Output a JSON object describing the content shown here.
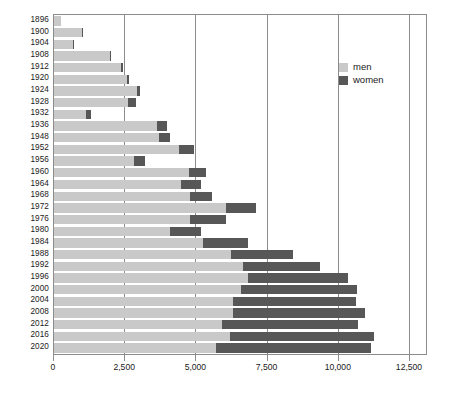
{
  "chart_data": {
    "type": "bar",
    "orientation": "horizontal",
    "stacked": true,
    "title": "",
    "subtitle": "",
    "xlabel": "",
    "ylabel": "",
    "xlim": [
      0,
      12500
    ],
    "ylim": null,
    "grid": true,
    "gridlines_x": [
      2500,
      5000,
      7500,
      10000,
      12500
    ],
    "legend_position": "top-right",
    "legend": [
      "men",
      "women"
    ],
    "xtick_labels": [
      "0",
      "2,500",
      "5,000",
      "7,500",
      "10,000",
      "12,500"
    ],
    "xticks": [
      0,
      2500,
      5000,
      7500,
      10000,
      12500
    ],
    "categories": [
      "1896",
      "1900",
      "1904",
      "1908",
      "1912",
      "1920",
      "1924",
      "1928",
      "1932",
      "1936",
      "1948",
      "1952",
      "1956",
      "1960",
      "1964",
      "1968",
      "1972",
      "1976",
      "1980",
      "1984",
      "1988",
      "1992",
      "1996",
      "2000",
      "2004",
      "2008",
      "2012",
      "2016",
      "2020"
    ],
    "series": [
      {
        "name": "men",
        "color": "#c9c9c9",
        "values": [
          240,
          975,
          650,
          1970,
          2360,
          2560,
          2900,
          2600,
          1130,
          3630,
          3700,
          4400,
          2810,
          4730,
          4470,
          4770,
          6040,
          4780,
          4060,
          5230,
          6200,
          6650,
          6800,
          6580,
          6290,
          6290,
          5890,
          6180,
          5690
        ]
      },
      {
        "name": "women",
        "color": "#575757",
        "values": [
          0,
          22,
          6,
          37,
          48,
          65,
          135,
          277,
          170,
          331,
          390,
          519,
          376,
          610,
          678,
          781,
          1059,
          1260,
          1115,
          1566,
          2194,
          2704,
          3512,
          4069,
          4329,
          4637,
          4776,
          5059,
          5440
        ]
      }
    ],
    "totals": [
      240,
      997,
      656,
      2007,
      2408,
      2625,
      3035,
      2877,
      1300,
      3961,
      4090,
      4919,
      3186,
      5340,
      5148,
      5551,
      7099,
      6040,
      5175,
      6796,
      8394,
      9354,
      10312,
      10649,
      10619,
      10927,
      10666,
      11239,
      11130
    ]
  },
  "legend": {
    "items": [
      {
        "label": "men",
        "color": "#c9c9c9"
      },
      {
        "label": "women",
        "color": "#575757"
      }
    ]
  }
}
